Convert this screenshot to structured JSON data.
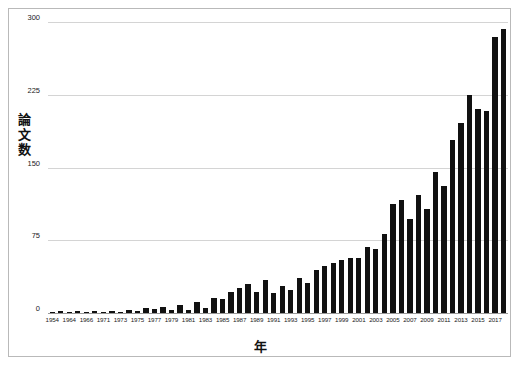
{
  "chart_data": {
    "type": "bar",
    "title": "",
    "xlabel": "年",
    "ylabel": "論文数",
    "ylim": [
      0,
      300
    ],
    "yticks": [
      0,
      75,
      150,
      225,
      300
    ],
    "ytick_labels": [
      "0",
      "75",
      "150",
      "225",
      "300"
    ],
    "grid": true,
    "legend": false,
    "bar_color": "#111111",
    "grid_color": "#d4d4d4",
    "frame_color": "#b9b9b9",
    "categories": [
      "1954",
      "1964",
      "1965",
      "1966",
      "1970",
      "1971",
      "1972",
      "1973",
      "1974",
      "1975",
      "1976",
      "1977",
      "1978",
      "1979",
      "1980",
      "1981",
      "1982",
      "1983",
      "1984",
      "1985",
      "1986",
      "1987",
      "1988",
      "1989",
      "1990",
      "1991",
      "1992",
      "1993",
      "1994",
      "1995",
      "1996",
      "1997",
      "1998",
      "1999",
      "2000",
      "2001",
      "2002",
      "2003",
      "2004",
      "2005",
      "2006",
      "2007",
      "2008",
      "2009",
      "2010",
      "2011",
      "2012",
      "2013",
      "2014",
      "2015",
      "2016",
      "2017",
      "2018",
      "2019"
    ],
    "xtick_labels": [
      "1954",
      "",
      "1964",
      "",
      "1966",
      "",
      "1971",
      "",
      "1973",
      "",
      "1975",
      "",
      "1977",
      "",
      "1979",
      "",
      "1981",
      "",
      "1983",
      "",
      "1985",
      "",
      "1987",
      "",
      "1989",
      "",
      "1991",
      "",
      "1993",
      "",
      "1995",
      "",
      "1997",
      "",
      "1999",
      "",
      "2001",
      "",
      "2003",
      "",
      "2005",
      "",
      "2007",
      "",
      "2009",
      "",
      "2011",
      "",
      "2013",
      "",
      "2015",
      "",
      "2017",
      "",
      "2019",
      ""
    ],
    "values": [
      1,
      2,
      1,
      2,
      1,
      2,
      1,
      2,
      1,
      3,
      2,
      5,
      4,
      6,
      3,
      8,
      3,
      11,
      5,
      15,
      14,
      22,
      26,
      30,
      22,
      34,
      21,
      28,
      24,
      36,
      31,
      44,
      48,
      52,
      55,
      57,
      57,
      68,
      66,
      81,
      112,
      117,
      97,
      122,
      107,
      145,
      131,
      178,
      196,
      225,
      210,
      208,
      285,
      293
    ]
  }
}
